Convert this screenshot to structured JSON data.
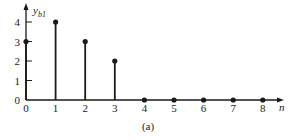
{
  "chart_data": {
    "type": "stem",
    "title": "",
    "caption": "(a)",
    "xlabel": "n",
    "ylabel": "y",
    "ylabel_subscript": "b1",
    "x": [
      0,
      1,
      2,
      3,
      4,
      5,
      6,
      7,
      8
    ],
    "values": [
      3,
      4,
      3,
      2,
      0,
      0,
      0,
      0,
      0
    ],
    "x_ticks": [
      "0",
      "1",
      "2",
      "3",
      "4",
      "5",
      "6",
      "7",
      "8"
    ],
    "y_ticks": [
      "0",
      "1",
      "2",
      "3",
      "4"
    ],
    "xlim": [
      0,
      8.7
    ],
    "ylim": [
      0,
      4.9
    ],
    "grid": false,
    "legend": null
  }
}
